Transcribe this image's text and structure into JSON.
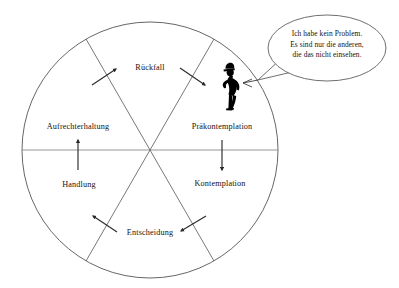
{
  "diagram": {
    "type": "cycle-wheel",
    "shape": "circle",
    "sector_count": 6,
    "colors": {
      "outline": "#555555",
      "diameter_line": "#8a8a8a",
      "arrow": "#2a2a2a",
      "figure": "#000000",
      "background": "#ffffff",
      "text": "#17110d"
    },
    "geometry": {
      "center_x": 150,
      "center_y": 150,
      "radius": 128
    }
  },
  "wheel": {
    "sectors": [
      {
        "id": "rueckfall",
        "label": "Rückfall",
        "x": 150,
        "y": 68,
        "position": "top"
      },
      {
        "id": "praekontemplation",
        "label": "Präkontemplation",
        "x": 222,
        "y": 127,
        "position": "upper-right"
      },
      {
        "id": "kontemplation",
        "label": "Kontemplation",
        "x": 220,
        "y": 184,
        "position": "lower-right"
      },
      {
        "id": "entscheidung",
        "label": "Entscheidung",
        "x": 150,
        "y": 233,
        "position": "bottom"
      },
      {
        "id": "handlung",
        "label": "Handlung",
        "x": 79,
        "y": 185,
        "position": "lower-left"
      },
      {
        "id": "aufrechterhaltung",
        "label": "Aufrechterhaltung",
        "x": 78,
        "y": 127,
        "position": "upper-left"
      }
    ]
  },
  "arrows": [
    {
      "id": "arrow-aufrechterhaltung-to-rueckfall",
      "direction": "up-right",
      "near": "Rückfall (links)"
    },
    {
      "id": "arrow-rueckfall-to-praekontemplation",
      "direction": "down-right",
      "near": "Rückfall (rechts)"
    },
    {
      "id": "arrow-praekontemplation-to-kontemplation",
      "direction": "down",
      "near": "Präkontemplation / Kontemplation"
    },
    {
      "id": "arrow-kontemplation-to-entscheidung",
      "direction": "down-left",
      "near": "Entscheidung (rechts)"
    },
    {
      "id": "arrow-entscheidung-to-handlung",
      "direction": "up-left",
      "near": "Entscheidung (links)"
    },
    {
      "id": "arrow-handlung-to-aufrechterhaltung",
      "direction": "up",
      "near": "Handlung / Aufrechterhaltung"
    }
  ],
  "figure": {
    "id": "person-silhouette",
    "x": 233,
    "y": 92
  },
  "speech_bubble": {
    "lines": [
      "Ich habe kein Problem.",
      "Es sind nur die anderen,",
      "die das nicht einsehen."
    ],
    "cx": 327,
    "cy": 48
  }
}
